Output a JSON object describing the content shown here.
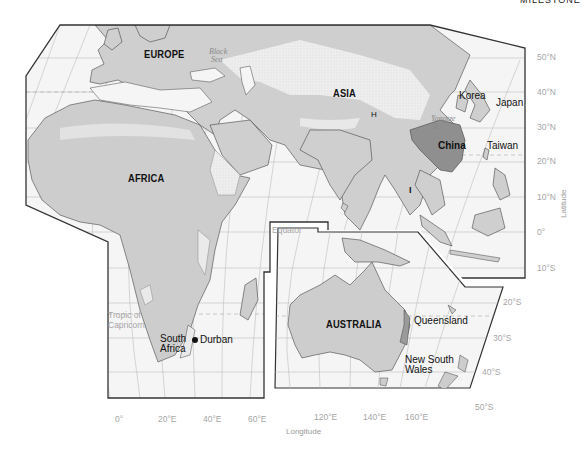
{
  "top_caption_fragment": "MILESTONE",
  "regions": {
    "europe": "EUROPE",
    "asia": "ASIA",
    "africa": "AFRICA",
    "australia": "AUSTRALIA"
  },
  "water_bodies": {
    "black_sea": [
      "Black",
      "Sea"
    ],
    "yangtze_river": [
      "Yangtze",
      "R."
    ],
    "equator": "Equator",
    "tropic_of_capricorn": [
      "Tropic of",
      "Capricorn"
    ]
  },
  "places": {
    "korea": "Korea",
    "japan": "Japan",
    "china": "China",
    "taiwan": "Taiwan",
    "south_africa": [
      "South",
      "Africa"
    ],
    "durban": "Durban",
    "queensland": "Queensland",
    "new_south_wales": [
      "New South",
      "Wales"
    ],
    "himalaya_marker": "H",
    "india_marker": "I"
  },
  "latitude_ticks": [
    "50°N",
    "40°N",
    "30°N",
    "20°N",
    "10°N",
    "0°",
    "10°S",
    "20°S",
    "30°S",
    "40°S",
    "50°S"
  ],
  "longitude_ticks": [
    "0°",
    "20°E",
    "40°E",
    "60°E",
    "120°E",
    "140°E",
    "160°E"
  ],
  "axis_titles": {
    "latitude": "Latitude",
    "longitude": "Longitude"
  },
  "colors": {
    "ocean": "#f4f4f4",
    "land": "#cdcdcd",
    "desert": "#ececec",
    "highlight_china": "#8f8f8f",
    "border": "#333333",
    "grid": "#b8b8b8",
    "axis_text": "#a6a6a6"
  }
}
